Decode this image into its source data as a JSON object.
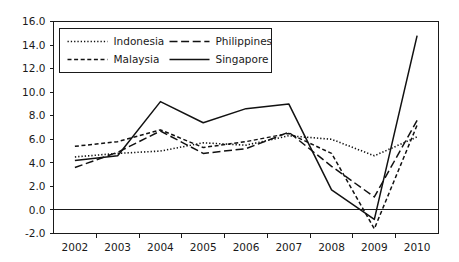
{
  "chart_data": {
    "type": "line",
    "title": "",
    "subtitle": "",
    "xlabel": "",
    "ylabel": "",
    "categories": [
      "2002",
      "2003",
      "2004",
      "2005",
      "2006",
      "2007",
      "2008",
      "2009",
      "2010"
    ],
    "x": [
      2002,
      2003,
      2004,
      2005,
      2006,
      2007,
      2008,
      2009,
      2010
    ],
    "ylim": [
      -2.0,
      16.0
    ],
    "ytick_step": 2.0,
    "ytick_labels": [
      "16.0",
      "14.0",
      "12.0",
      "10.0",
      "8.0",
      "6.0",
      "4.0",
      "2.0",
      "0.0",
      "-2.0"
    ],
    "ytick_values": [
      16.0,
      14.0,
      12.0,
      10.0,
      8.0,
      6.0,
      4.0,
      2.0,
      0.0,
      -2.0
    ],
    "grid": false,
    "zero_line": true,
    "legend_position": "top-left-inside",
    "series": [
      {
        "name": "Indonesia",
        "style": "dotted",
        "color": "#111111",
        "values": [
          4.5,
          4.8,
          5.0,
          5.7,
          5.5,
          6.3,
          6.0,
          4.6,
          6.2
        ]
      },
      {
        "name": "Malaysia",
        "style": "short-dash",
        "color": "#111111",
        "values": [
          5.4,
          5.8,
          6.8,
          5.3,
          5.8,
          6.5,
          4.8,
          -1.6,
          7.2
        ]
      },
      {
        "name": "Philippines",
        "style": "long-dash",
        "color": "#111111",
        "values": [
          3.6,
          4.9,
          6.7,
          4.8,
          5.2,
          6.6,
          3.7,
          1.1,
          7.6
        ]
      },
      {
        "name": "Singapore",
        "style": "solid",
        "color": "#111111",
        "values": [
          4.2,
          4.6,
          9.2,
          7.4,
          8.6,
          9.0,
          1.7,
          -0.8,
          14.8
        ]
      }
    ]
  },
  "legend": {
    "entries": [
      {
        "label": "Indonesia",
        "style": "dotted"
      },
      {
        "label": "Philippines",
        "style": "long-dash"
      },
      {
        "label": "Malaysia",
        "style": "short-dash"
      },
      {
        "label": "Singapore",
        "style": "solid"
      }
    ]
  },
  "colors": {
    "ink": "#111111",
    "axis": "#1a1a1a",
    "background": "#ffffff"
  }
}
